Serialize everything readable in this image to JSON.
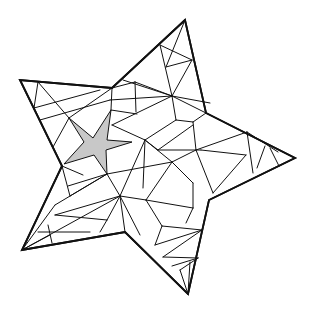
{
  "figure": {
    "colors": {
      "line": "#111111",
      "shade": "#c8c8c8",
      "background": "#ffffff"
    },
    "outer_star": {
      "points": [
        [
          185,
          20
        ],
        [
          112,
          88
        ],
        [
          20,
          80
        ],
        [
          62,
          166
        ],
        [
          22,
          250
        ],
        [
          125,
          232
        ],
        [
          188,
          294
        ],
        [
          209,
          200
        ],
        [
          295,
          158
        ],
        [
          206,
          113
        ]
      ]
    },
    "inner_star": {
      "points": [
        [
          69,
          118
        ],
        [
          93,
          138
        ],
        [
          111,
          110
        ],
        [
          107,
          140
        ],
        [
          132,
          142
        ],
        [
          106,
          150
        ],
        [
          107,
          174
        ],
        [
          94,
          155
        ],
        [
          64,
          164
        ],
        [
          84,
          142
        ]
      ]
    },
    "edges": [
      [
        [
          38,
          82
        ],
        [
          34,
          108
        ]
      ],
      [
        [
          38,
          82
        ],
        [
          69,
          118
        ]
      ],
      [
        [
          34,
          108
        ],
        [
          100,
          90
        ]
      ],
      [
        [
          40,
          120
        ],
        [
          110,
          100
        ]
      ],
      [
        [
          69,
          118
        ],
        [
          53,
          147
        ]
      ],
      [
        [
          69,
          118
        ],
        [
          112,
          88
        ]
      ],
      [
        [
          112,
          88
        ],
        [
          111,
          110
        ]
      ],
      [
        [
          111,
          110
        ],
        [
          137,
          114
        ]
      ],
      [
        [
          112,
          88
        ],
        [
          135,
          82
        ]
      ],
      [
        [
          135,
          82
        ],
        [
          136,
          112
        ]
      ],
      [
        [
          135,
          82
        ],
        [
          172,
          96
        ]
      ],
      [
        [
          160,
          45
        ],
        [
          172,
          96
        ]
      ],
      [
        [
          160,
          45
        ],
        [
          192,
          60
        ]
      ],
      [
        [
          166,
          67
        ],
        [
          192,
          60
        ]
      ],
      [
        [
          166,
          67
        ],
        [
          185,
          20
        ]
      ],
      [
        [
          172,
          96
        ],
        [
          192,
          60
        ]
      ],
      [
        [
          172,
          96
        ],
        [
          206,
          113
        ]
      ],
      [
        [
          172,
          96
        ],
        [
          112,
          125
        ]
      ],
      [
        [
          172,
          96
        ],
        [
          176,
          120
        ]
      ],
      [
        [
          112,
          125
        ],
        [
          145,
          140
        ]
      ],
      [
        [
          110,
          100
        ],
        [
          172,
          96
        ]
      ],
      [
        [
          123,
          80
        ],
        [
          172,
          96
        ]
      ],
      [
        [
          176,
          120
        ],
        [
          145,
          140
        ]
      ],
      [
        [
          176,
          120
        ],
        [
          193,
          122
        ]
      ],
      [
        [
          193,
          122
        ],
        [
          206,
          113
        ]
      ],
      [
        [
          193,
          122
        ],
        [
          196,
          150
        ]
      ],
      [
        [
          172,
          96
        ],
        [
          210,
          103
        ]
      ],
      [
        [
          145,
          140
        ],
        [
          172,
          162
        ]
      ],
      [
        [
          145,
          140
        ],
        [
          120,
          196
        ]
      ],
      [
        [
          145,
          140
        ],
        [
          143,
          188
        ]
      ],
      [
        [
          145,
          140
        ],
        [
          158,
          150
        ]
      ],
      [
        [
          158,
          150
        ],
        [
          193,
          125
        ]
      ],
      [
        [
          158,
          150
        ],
        [
          201,
          150
        ]
      ],
      [
        [
          196,
          150
        ],
        [
          247,
          132
        ]
      ],
      [
        [
          201,
          150
        ],
        [
          246,
          155
        ]
      ],
      [
        [
          247,
          132
        ],
        [
          253,
          173
        ]
      ],
      [
        [
          247,
          132
        ],
        [
          278,
          152
        ]
      ],
      [
        [
          265,
          146
        ],
        [
          257,
          168
        ]
      ],
      [
        [
          270,
          148
        ],
        [
          279,
          166
        ]
      ],
      [
        [
          196,
          150
        ],
        [
          213,
          193
        ]
      ],
      [
        [
          246,
          155
        ],
        [
          213,
          193
        ]
      ],
      [
        [
          172,
          162
        ],
        [
          196,
          150
        ]
      ],
      [
        [
          172,
          162
        ],
        [
          193,
          183
        ]
      ],
      [
        [
          172,
          162
        ],
        [
          107,
          174
        ]
      ],
      [
        [
          172,
          162
        ],
        [
          146,
          200
        ]
      ],
      [
        [
          193,
          183
        ],
        [
          193,
          208
        ]
      ],
      [
        [
          146,
          200
        ],
        [
          193,
          208
        ]
      ],
      [
        [
          146,
          200
        ],
        [
          162,
          226
        ]
      ],
      [
        [
          162,
          226
        ],
        [
          202,
          230
        ]
      ],
      [
        [
          162,
          226
        ],
        [
          155,
          245
        ]
      ],
      [
        [
          193,
          208
        ],
        [
          186,
          223
        ]
      ],
      [
        [
          202,
          230
        ],
        [
          155,
          245
        ]
      ],
      [
        [
          202,
          230
        ],
        [
          163,
          257
        ]
      ],
      [
        [
          163,
          257
        ],
        [
          198,
          258
        ]
      ],
      [
        [
          198,
          258
        ],
        [
          180,
          270
        ]
      ],
      [
        [
          180,
          270
        ],
        [
          188,
          294
        ]
      ],
      [
        [
          190,
          262
        ],
        [
          188,
          294
        ]
      ],
      [
        [
          172,
          266
        ],
        [
          198,
          258
        ]
      ],
      [
        [
          120,
          196
        ],
        [
          146,
          200
        ]
      ],
      [
        [
          120,
          196
        ],
        [
          125,
          232
        ]
      ],
      [
        [
          120,
          196
        ],
        [
          140,
          235
        ]
      ],
      [
        [
          120,
          196
        ],
        [
          107,
          174
        ]
      ],
      [
        [
          107,
          174
        ],
        [
          70,
          196
        ]
      ],
      [
        [
          107,
          174
        ],
        [
          68,
          186
        ]
      ],
      [
        [
          107,
          174
        ],
        [
          55,
          205
        ]
      ],
      [
        [
          62,
          166
        ],
        [
          83,
          175
        ]
      ],
      [
        [
          62,
          166
        ],
        [
          70,
          196
        ]
      ],
      [
        [
          55,
          205
        ],
        [
          22,
          250
        ]
      ],
      [
        [
          55,
          215
        ],
        [
          120,
          196
        ]
      ],
      [
        [
          55,
          215
        ],
        [
          107,
          220
        ]
      ],
      [
        [
          107,
          220
        ],
        [
          100,
          232
        ]
      ],
      [
        [
          107,
          220
        ],
        [
          120,
          196
        ]
      ],
      [
        [
          48,
          225
        ],
        [
          52,
          243
        ]
      ],
      [
        [
          50,
          235
        ],
        [
          22,
          250
        ]
      ],
      [
        [
          38,
          232
        ],
        [
          90,
          232
        ]
      ],
      [
        [
          22,
          250
        ],
        [
          120,
          196
        ]
      ]
    ]
  }
}
